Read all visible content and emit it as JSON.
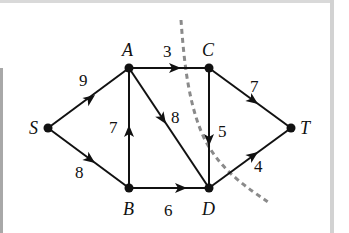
{
  "diagram": {
    "type": "directed flow network with cut",
    "colors": {
      "edge": "#111111",
      "node": "#111111",
      "cut": "#8a8a8a",
      "background": "#ffffff"
    },
    "nodes": [
      {
        "id": "S",
        "label": "S",
        "x": 48,
        "y": 128
      },
      {
        "id": "A",
        "label": "A",
        "x": 129,
        "y": 68
      },
      {
        "id": "C",
        "label": "C",
        "x": 209,
        "y": 68
      },
      {
        "id": "B",
        "label": "B",
        "x": 129,
        "y": 188
      },
      {
        "id": "D",
        "label": "D",
        "x": 209,
        "y": 188
      },
      {
        "id": "T",
        "label": "T",
        "x": 291,
        "y": 128
      }
    ],
    "edges": [
      {
        "from": "S",
        "to": "A",
        "capacity": "9"
      },
      {
        "from": "S",
        "to": "B",
        "capacity": "8"
      },
      {
        "from": "B",
        "to": "A",
        "capacity": "7"
      },
      {
        "from": "A",
        "to": "C",
        "capacity": "3"
      },
      {
        "from": "A",
        "to": "D",
        "capacity": "8"
      },
      {
        "from": "B",
        "to": "D",
        "capacity": "6"
      },
      {
        "from": "C",
        "to": "D",
        "capacity": "5"
      },
      {
        "from": "C",
        "to": "T",
        "capacity": "7"
      },
      {
        "from": "D",
        "to": "T",
        "capacity": "4"
      }
    ],
    "cut": {
      "style": "dashed",
      "crosses": [
        "A-C",
        "C-D",
        "D-T"
      ]
    }
  },
  "labels": {
    "S": "S",
    "A": "A",
    "B": "B",
    "C": "C",
    "D": "D",
    "T": "T",
    "SA": "9",
    "SB": "8",
    "BA": "7",
    "AC": "3",
    "AD": "8",
    "BD": "6",
    "CD": "5",
    "CT": "7",
    "DT": "4"
  }
}
